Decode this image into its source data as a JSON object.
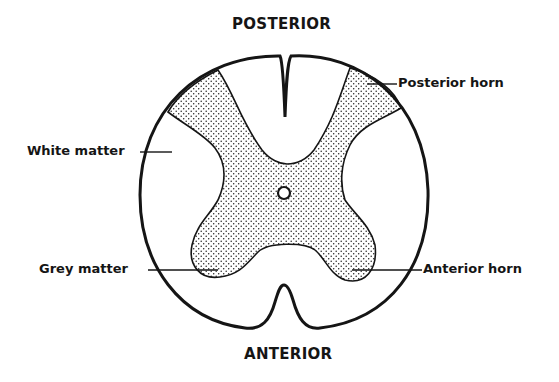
{
  "diagram": {
    "orientation": {
      "top": "POSTERIOR",
      "bottom": "ANTERIOR"
    },
    "labels": {
      "posterior_horn": "Posterior horn",
      "white_matter": "White matter",
      "grey_matter": "Grey matter",
      "anterior_horn": "Anterior horn"
    },
    "colors": {
      "ink": "#151515",
      "background": "#ffffff",
      "grey_matter_dots": "#222222"
    }
  }
}
